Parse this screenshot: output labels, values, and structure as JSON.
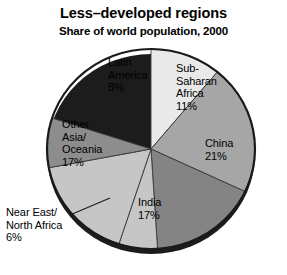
{
  "chart_data": {
    "type": "pie",
    "title": "Less–developed regions",
    "subtitle": "Share of world population, 2000",
    "xlabel": "",
    "ylabel": "",
    "legend": "none",
    "units": "percent of world population",
    "categories": [
      "Sub-Saharan Africa",
      "China",
      "India",
      "Near East/North Africa",
      "Other Asia/Oceania",
      "Latin America"
    ],
    "values": [
      11,
      21,
      17,
      6,
      17,
      8
    ],
    "start_angle_deg": 0,
    "direction": "clockwise",
    "slices": [
      {
        "name": "sub-saharan-africa",
        "label": "Sub-\nSaharan\nAfrica\n11%",
        "value": 11,
        "color": "#e9e9e9",
        "start_deg": 0,
        "end_deg": 39.6,
        "label_position": "inside"
      },
      {
        "name": "china",
        "label": "China\n21%",
        "value": 21,
        "color": "#a6a6a6",
        "start_deg": 39.6,
        "end_deg": 115.2,
        "label_position": "inside"
      },
      {
        "name": "india",
        "label": "India\n17%",
        "value": 17,
        "color": "#848484",
        "start_deg": 115.2,
        "end_deg": 176.4,
        "label_position": "inside"
      },
      {
        "name": "near-east-north-africa",
        "label": "Near East/\nNorth Africa\n6%",
        "value": 6,
        "color": "#c6c6c6",
        "start_deg": 176.4,
        "end_deg": 198.0,
        "label_position": "outside-left"
      },
      {
        "name": "other-asia-oceania",
        "label": "Other\nAsia/\nOceania\n17%",
        "value": 17,
        "color": "#c6c6c6",
        "start_deg": 198.0,
        "end_deg": 259.2,
        "label_position": "inside"
      },
      {
        "name": "latin-america",
        "label": "Latin\nAmerica\n8%",
        "value": 8,
        "color": "#8d8d8d",
        "start_deg": 259.2,
        "end_deg": 288.0,
        "label_position": "inside"
      }
    ],
    "style": {
      "background": "#ffffff",
      "outline_color": "#1a1a1a",
      "shadow_color": "#1c1c1c",
      "text_color": "#000000"
    }
  }
}
